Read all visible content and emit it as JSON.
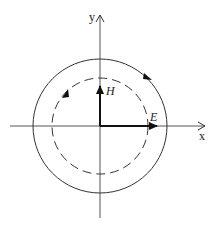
{
  "diagram": {
    "axes": {
      "x_label": "x",
      "y_label": "y"
    },
    "vectors": {
      "E_label": "E",
      "H_label": "H"
    },
    "circles": {
      "outer": {
        "style": "solid",
        "rotation": "clockwise"
      },
      "inner": {
        "style": "dashed",
        "rotation": "clockwise"
      }
    },
    "colors": {
      "stroke": "#333333",
      "background": "#ffffff"
    }
  }
}
